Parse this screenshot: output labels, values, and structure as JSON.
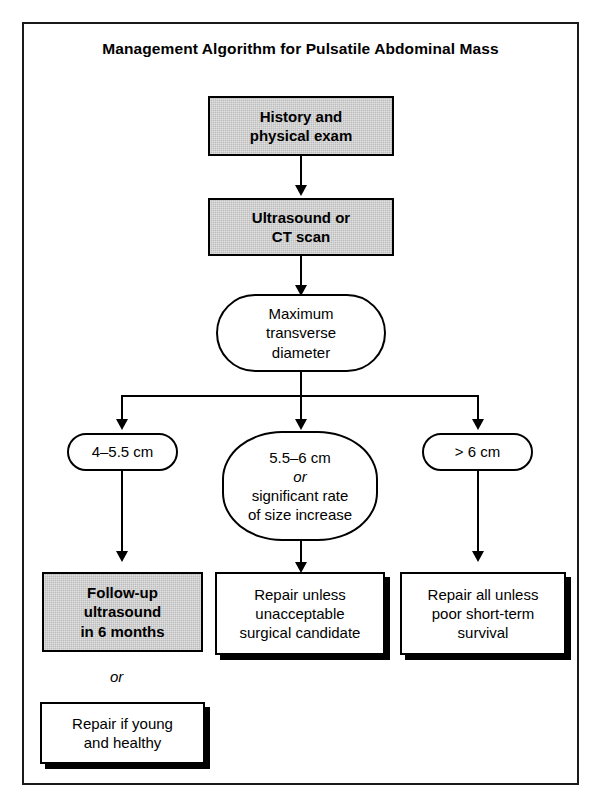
{
  "figure": {
    "title": "Management Algorithm for Pulsatile Abdominal Mass",
    "type": "flowchart"
  },
  "colors": {
    "gray_fill": "#bdbdbd",
    "white_fill": "#ffffff",
    "stroke": "#000000",
    "shadow": "#000000"
  },
  "nodes": {
    "history": {
      "line1": "History and",
      "line2": "physical exam",
      "shape": "rectangle",
      "fill": "gray"
    },
    "imaging": {
      "line1": "Ultrasound or",
      "line2": "CT scan",
      "shape": "rectangle",
      "fill": "gray"
    },
    "measurement": {
      "line1": "Maximum",
      "line2": "transverse",
      "line3": "diameter",
      "shape": "stadium",
      "fill": "white"
    },
    "branch_small": {
      "label": "4–5.5 cm",
      "shape": "stadium",
      "fill": "white"
    },
    "branch_medium": {
      "line1": "5.5–6 cm",
      "line2": "or",
      "line3": "significant rate",
      "line4": "of size increase",
      "shape": "rounded-rectangle",
      "fill": "white"
    },
    "branch_large": {
      "label": "> 6 cm",
      "shape": "stadium",
      "fill": "white"
    },
    "outcome_surveillance": {
      "line1": "Follow-up",
      "line2": "ultrasound",
      "line3": "in 6 months",
      "shape": "rectangle",
      "fill": "gray"
    },
    "outcome_repair_unless": {
      "line1": "Repair unless",
      "line2": "unacceptable",
      "line3": "surgical candidate",
      "shape": "rectangle",
      "fill": "white"
    },
    "outcome_repair_all": {
      "line1": "Repair all unless",
      "line2": "poor short-term",
      "line3": "survival",
      "shape": "rectangle",
      "fill": "white"
    },
    "alternative_connector": {
      "label": "or"
    },
    "outcome_repair_young": {
      "line1": "Repair if young",
      "line2": "and healthy",
      "shape": "rectangle",
      "fill": "white"
    }
  }
}
